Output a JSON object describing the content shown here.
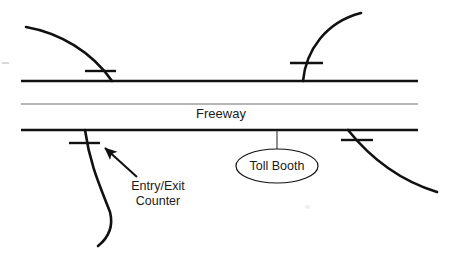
{
  "canvas": {
    "width": 460,
    "height": 268,
    "background": "#ffffff"
  },
  "style": {
    "line_color": "#111111",
    "thin_line_color": "#6e6e6e",
    "text_color": "#1a1a1a",
    "ramp_color": "#111111",
    "tick_color": "#111111",
    "ellipse_stroke": "#111111",
    "ellipse_fill": "#ffffff",
    "arrow_color": "#111111"
  },
  "labels": {
    "freeway": "Freeway",
    "toll_booth": "Toll Booth",
    "counter_line1": "Entry/Exit",
    "counter_line2": "Counter"
  },
  "diagram": {
    "freeway_lines": [
      {
        "name": "upper-carriageway",
        "x1": 21,
        "y1": 81,
        "x2": 418,
        "y2": 81,
        "weight": 2.6,
        "color": "#111111"
      },
      {
        "name": "median-line",
        "x1": 21,
        "y1": 104,
        "x2": 418,
        "y2": 104,
        "weight": 1.1,
        "color": "#6e6e6e"
      },
      {
        "name": "lower-carriageway",
        "x1": 21,
        "y1": 130,
        "x2": 418,
        "y2": 130,
        "weight": 2.6,
        "color": "#111111"
      }
    ],
    "ramps": [
      {
        "name": "ramp-top-left",
        "path": "M26,27 C60,33 92,52 112,81",
        "weight": 2.6
      },
      {
        "name": "ramp-top-right",
        "path": "M303,81 C306,50 326,22 361,13",
        "weight": 2.6
      },
      {
        "name": "ramp-bottom-left",
        "path": "M85,130 C90,165 100,186 110,212 C114,228 108,238 98,246",
        "weight": 2.6
      },
      {
        "name": "ramp-bottom-right",
        "path": "M348,130 C368,155 398,180 437,192",
        "weight": 2.6
      }
    ],
    "counter_ticks": [
      {
        "name": "counter-tick-top-left",
        "x1": 85,
        "y1": 71,
        "x2": 116,
        "y2": 71,
        "weight": 2.4
      },
      {
        "name": "counter-tick-top-right",
        "x1": 290,
        "y1": 63,
        "x2": 323,
        "y2": 63,
        "weight": 2.4
      },
      {
        "name": "counter-tick-bottom-left",
        "x1": 69,
        "y1": 143,
        "x2": 100,
        "y2": 143,
        "weight": 2.4
      },
      {
        "name": "counter-tick-bottom-right",
        "x1": 341,
        "y1": 140,
        "x2": 373,
        "y2": 140,
        "weight": 2.4
      }
    ],
    "toll_booth": {
      "leader": {
        "x1": 277,
        "y1": 130,
        "x2": 277,
        "y2": 149
      },
      "ellipse": {
        "cx": 277,
        "cy": 166,
        "rx": 41,
        "ry": 17
      }
    },
    "counter_callout": {
      "arrow_tail_x": 137,
      "arrow_tail_y": 177,
      "arrow_tip_x": 103,
      "arrow_tip_y": 146,
      "text_x": 158,
      "text_y": 190,
      "line_height": 15
    },
    "freeway_label": {
      "x": 221,
      "y": 118
    },
    "specks": [
      {
        "name": "scan-speck-left",
        "x": 2,
        "y": 62,
        "w": 7,
        "h": 2
      },
      {
        "name": "scan-speck-mid",
        "x": 305,
        "y": 205,
        "w": 5,
        "h": 4
      }
    ]
  }
}
